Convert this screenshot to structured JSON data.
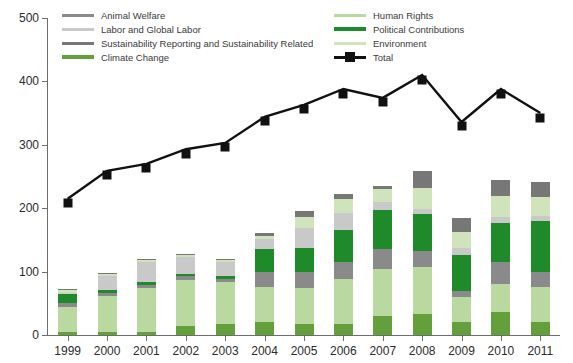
{
  "legend": {
    "left_column": [
      {
        "label": "Animal Welfare",
        "color": "#8a8a8a",
        "key": "animal_welfare"
      },
      {
        "label": "Labor and Global Labor",
        "color": "#c9c9c9",
        "key": "labor"
      },
      {
        "label": "Sustainability Reporting and Sustainability Related",
        "color": "#777777",
        "key": "sustainability"
      },
      {
        "label": "Climate Change",
        "color": "#63a03c",
        "key": "climate_change"
      }
    ],
    "right_column": [
      {
        "label": "Human Rights",
        "color": "#b9d9a0",
        "key": "human_rights"
      },
      {
        "label": "Political Contributions",
        "color": "#1f8a2a",
        "key": "political_contributions"
      },
      {
        "label": "Environment",
        "color": "#cfe4bb",
        "key": "environment"
      },
      {
        "label": "Total",
        "color": "#111111",
        "key": "total"
      }
    ]
  },
  "axes": {
    "y_ticks": [
      0,
      100,
      200,
      300,
      400,
      500
    ],
    "y_min": 0,
    "y_max": 500,
    "x_labels": [
      "1999",
      "2000",
      "2001",
      "2002",
      "2003",
      "2004",
      "2005",
      "2006",
      "2007",
      "2008",
      "2009",
      "2010",
      "2011"
    ]
  },
  "chart_data": {
    "type": "bar",
    "title": "",
    "xlabel": "",
    "ylabel": "",
    "ylim": [
      0,
      500
    ],
    "grid": false,
    "legend_position": "top",
    "stacked": true,
    "categories": [
      "1999",
      "2000",
      "2001",
      "2002",
      "2003",
      "2004",
      "2005",
      "2006",
      "2007",
      "2008",
      "2009",
      "2010",
      "2011"
    ],
    "stack_order_bottom_to_top": [
      "climate_change",
      "human_rights",
      "animal_welfare",
      "political_contributions",
      "labor",
      "environment",
      "sustainability"
    ],
    "series": [
      {
        "name": "Climate Change",
        "key": "climate_change",
        "color": "#63a03c",
        "values": [
          4,
          4,
          4,
          14,
          18,
          20,
          17,
          17,
          30,
          33,
          21,
          36,
          20
        ]
      },
      {
        "name": "Human Rights",
        "key": "human_rights",
        "color": "#b9d9a0",
        "values": [
          40,
          58,
          70,
          73,
          65,
          55,
          57,
          72,
          74,
          74,
          39,
          45,
          55
        ]
      },
      {
        "name": "Animal Welfare",
        "key": "animal_welfare",
        "color": "#8a8a8a",
        "values": [
          6,
          5,
          5,
          6,
          6,
          25,
          25,
          26,
          32,
          26,
          10,
          34,
          25
        ]
      },
      {
        "name": "Political Contributions",
        "key": "political_contributions",
        "color": "#1f8a2a",
        "values": [
          14,
          4,
          4,
          4,
          4,
          36,
          38,
          50,
          62,
          58,
          57,
          62,
          80
        ]
      },
      {
        "name": "Labor and Global Labor",
        "key": "labor",
        "color": "#c9c9c9",
        "values": [
          3,
          22,
          32,
          26,
          22,
          16,
          32,
          27,
          12,
          8,
          10,
          10,
          8
        ]
      },
      {
        "name": "Environment",
        "key": "environment",
        "color": "#cfe4bb",
        "values": [
          4,
          3,
          3,
          3,
          3,
          4,
          18,
          22,
          20,
          33,
          25,
          32,
          30
        ]
      },
      {
        "name": "Sustainability Reporting and Sustainability Related",
        "key": "sustainability",
        "color": "#777777",
        "values": [
          2,
          2,
          2,
          2,
          2,
          5,
          8,
          8,
          5,
          26,
          23,
          26,
          24
        ]
      }
    ],
    "totals": {
      "name": "Total",
      "color": "#111111",
      "marker": "square",
      "values": [
        215,
        259,
        270,
        293,
        303,
        344,
        363,
        388,
        374,
        410,
        336,
        388,
        350
      ]
    }
  }
}
